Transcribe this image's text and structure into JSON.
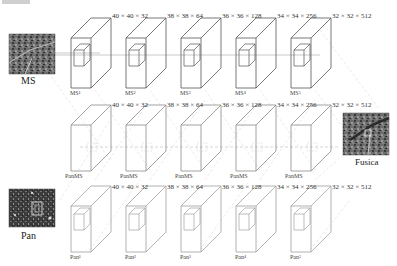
{
  "diagram": {
    "inputs": {
      "ms_label": "MS",
      "pan_label": "Pan",
      "output_label": "Fusica"
    },
    "rows": [
      {
        "name": "ms-branch",
        "layers": [
          {
            "dims": "40 × 40 × 32",
            "name": "MS¹"
          },
          {
            "dims": "38 × 38 × 64",
            "name": "MS²"
          },
          {
            "dims": "36 × 36 × 128",
            "name": "MS³"
          },
          {
            "dims": "34 × 34 × 256",
            "name": "MS⁴"
          },
          {
            "dims": "32 × 32 × 512",
            "name": "MS⁵"
          }
        ]
      },
      {
        "name": "panms-branch",
        "layers": [
          {
            "dims": "40 × 40 × 32",
            "name": "PanMS"
          },
          {
            "dims": "38 × 38 × 64",
            "name": "PanMS"
          },
          {
            "dims": "36 × 36 × 128",
            "name": "PanMS"
          },
          {
            "dims": "34 × 34 × 256",
            "name": "PanMS"
          },
          {
            "dims": "32 × 32 × 512",
            "name": "PanMS"
          }
        ]
      },
      {
        "name": "pan-branch",
        "layers": [
          {
            "dims": "40 × 40 × 32",
            "name": "Pan¹"
          },
          {
            "dims": "38 × 38 × 64",
            "name": "Pan²"
          },
          {
            "dims": "36 × 36 × 128",
            "name": "Pan³"
          },
          {
            "dims": "34 × 34 × 256",
            "name": "Pan⁴"
          },
          {
            "dims": "32 × 32 × 512",
            "name": "Pan⁵"
          }
        ]
      }
    ],
    "colors": {
      "box_stroke_top": "#555555",
      "box_stroke_mid": "#8a8a8a",
      "box_stroke_bot": "#a0a0a0",
      "dashed_line": "#d8d8d8",
      "connector": "#b0b0b0"
    }
  }
}
